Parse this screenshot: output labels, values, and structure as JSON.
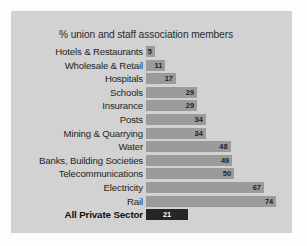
{
  "chart_data": {
    "type": "bar",
    "orientation": "horizontal",
    "title": "% union and staff association members",
    "xlabel": "",
    "ylabel": "",
    "xlim": [
      0,
      80
    ],
    "grid": false,
    "legend": null,
    "value_labels_inside_bars": true,
    "categories": [
      "Hotels & Restaurants",
      "Wholesale & Retail",
      "Hospitals",
      "Schools",
      "Insurance",
      "Posts",
      "Mining & Quarrying",
      "Water",
      "Banks, Building Societies",
      "Telecommunications",
      "Electricity",
      "Rail",
      "All Private Sector"
    ],
    "values": [
      5,
      11,
      17,
      29,
      29,
      34,
      34,
      48,
      49,
      50,
      67,
      74,
      21
    ],
    "bars": [
      {
        "label": "Hotels & Restaurants",
        "value": 5,
        "value_text": "5",
        "highlight": false
      },
      {
        "label": "Wholesale & Retail",
        "value": 11,
        "value_text": "11",
        "highlight": false
      },
      {
        "label": "Hospitals",
        "value": 17,
        "value_text": "17",
        "highlight": false
      },
      {
        "label": "Schools",
        "value": 29,
        "value_text": "29",
        "highlight": false
      },
      {
        "label": "Insurance",
        "value": 29,
        "value_text": "29",
        "highlight": false
      },
      {
        "label": "Posts",
        "value": 34,
        "value_text": "34",
        "highlight": false
      },
      {
        "label": "Mining & Quarrying",
        "value": 34,
        "value_text": "34",
        "highlight": false
      },
      {
        "label": "Water",
        "value": 48,
        "value_text": "48",
        "highlight": false
      },
      {
        "label": "Banks, Building Societies",
        "value": 49,
        "value_text": "49",
        "highlight": false
      },
      {
        "label": "Telecommunications",
        "value": 50,
        "value_text": "50",
        "highlight": false
      },
      {
        "label": "Electricity",
        "value": 67,
        "value_text": "67",
        "highlight": false
      },
      {
        "label": "Rail",
        "value": 74,
        "value_text": "74",
        "highlight": false
      },
      {
        "label": "All Private Sector",
        "value": 21,
        "value_text": "21",
        "highlight": true
      }
    ],
    "colors": {
      "panel_background": "#d2d2d2",
      "page_background": "#fdfdfd",
      "bar": "#9b9b9b",
      "bar_highlight": "#262626",
      "value_text": "#1d1d1d",
      "value_text_highlight": "#ffffff",
      "label_text": "#242424",
      "title_text": "#2b2b2b"
    },
    "scale_px_per_unit": 1.76,
    "bar_origin_x_px": 136
  }
}
